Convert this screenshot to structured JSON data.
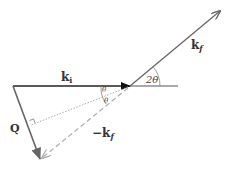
{
  "diagram": {
    "labels": {
      "ki": "k",
      "ki_sub": "i",
      "kf": "k",
      "kf_sub": "f",
      "neg_kf": "−k",
      "neg_kf_sub": "f",
      "Q": "Q",
      "theta_top": "θ",
      "theta_bottom": "θ",
      "two_theta": "2θ"
    },
    "colors": {
      "ki": "#222222",
      "kf": "#666666",
      "Q": "#666666",
      "neg_kf": "#aaaaaa",
      "bisector": "#aaaaaa"
    }
  }
}
